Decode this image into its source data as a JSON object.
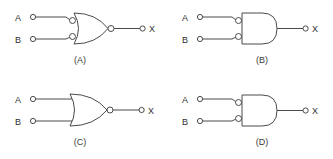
{
  "figure": {
    "title": "",
    "background_color": "#ffffff",
    "line_color": "#4a4a4a",
    "text_color": "#2e2e2e",
    "width": 333,
    "height": 159
  },
  "gates": [
    {
      "id": "A",
      "caption": "(A)",
      "gate_type": "NOR",
      "body_shape": "or",
      "output_bubble": true,
      "input_bubbles": true,
      "inputs": [
        {
          "label": "A"
        },
        {
          "label": "B"
        }
      ],
      "output": {
        "label": "X"
      }
    },
    {
      "id": "B",
      "caption": "(B)",
      "gate_type": "AND",
      "body_shape": "and",
      "output_bubble": false,
      "input_bubbles": true,
      "inputs": [
        {
          "label": "A"
        },
        {
          "label": "B"
        }
      ],
      "output": {
        "label": "X"
      }
    },
    {
      "id": "C",
      "caption": "(C)",
      "gate_type": "NOR",
      "body_shape": "or",
      "output_bubble": true,
      "input_bubbles": false,
      "inputs": [
        {
          "label": "A"
        },
        {
          "label": "B"
        }
      ],
      "output": {
        "label": "X"
      }
    },
    {
      "id": "D",
      "caption": "(D)",
      "gate_type": "AND",
      "body_shape": "and",
      "output_bubble": false,
      "input_bubbles": true,
      "inputs": [
        {
          "label": "A"
        },
        {
          "label": "B"
        }
      ],
      "output": {
        "label": "X"
      }
    }
  ]
}
